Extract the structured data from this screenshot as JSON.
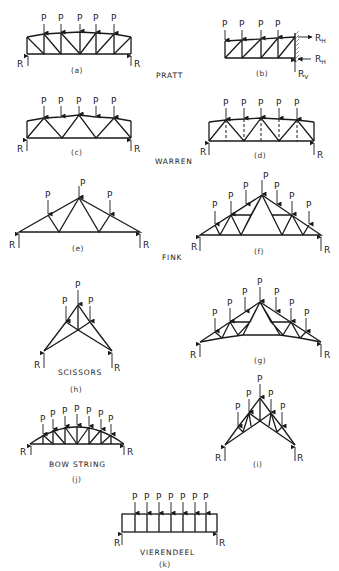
{
  "figure": {
    "load_label": "P",
    "reaction_label": "R",
    "reaction_horizontal": "R",
    "reaction_horizontal_sub": "H",
    "reaction_vertical": "R",
    "reaction_vertical_sub": "V",
    "groups": {
      "pratt": "PRATT",
      "warren": "WARREN",
      "fink": "FINK",
      "scissors": "SCISSORS",
      "bowstring": "BOW STRING",
      "vierendeel": "VIERENDEEL"
    },
    "captions": {
      "a": "(a)",
      "b": "(b)",
      "c": "(c)",
      "d": "(d)",
      "e": "(e)",
      "f": "(f)",
      "g": "(g)",
      "h": "(h)",
      "i": "(i)",
      "j": "(j)",
      "k": "(k)"
    },
    "panels": [
      {
        "id": "a",
        "type": "Pratt, simply supported",
        "loads": 5
      },
      {
        "id": "b",
        "type": "Pratt, cantilever",
        "loads": 4
      },
      {
        "id": "c",
        "type": "Warren",
        "loads": 5
      },
      {
        "id": "d",
        "type": "Warren with verticals",
        "loads": 5
      },
      {
        "id": "e",
        "type": "Fink",
        "loads": 3
      },
      {
        "id": "f",
        "type": "Fink (compound)",
        "loads": 7
      },
      {
        "id": "g",
        "type": "Fink, cambered bottom chord",
        "loads": 7
      },
      {
        "id": "h",
        "type": "Scissors",
        "loads": 3
      },
      {
        "id": "i",
        "type": "Scissors (compound)",
        "loads": 5
      },
      {
        "id": "j",
        "type": "Bow string",
        "loads": 7
      },
      {
        "id": "k",
        "type": "Vierendeel",
        "loads": 7
      }
    ]
  }
}
